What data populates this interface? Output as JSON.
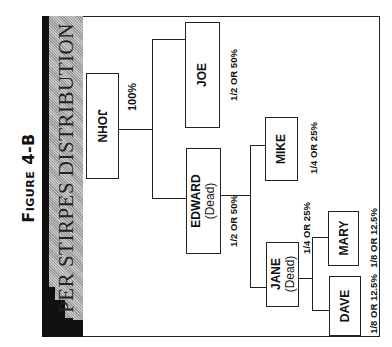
{
  "figure": {
    "label_prefix": "Figure",
    "label_number": "4-B",
    "title": "PER STIRPES DISTRIBUTION"
  },
  "colors": {
    "border": "#222222",
    "title_bar": "#111111",
    "band_gray": "#b0b0b0",
    "background": "#ffffff"
  },
  "tree": {
    "root": {
      "name": "JOHN",
      "share": "100%"
    },
    "children": [
      {
        "name": "JOE",
        "share": "1/2 OR 50%"
      },
      {
        "name": "EDWARD",
        "status": "(Dead)",
        "share": "1/2 OR 50%",
        "children": [
          {
            "name": "MIKE",
            "share": "1/4 OR 25%"
          },
          {
            "name": "JANE",
            "status": "(Dead)",
            "share": "1/4 OR 25%",
            "children": [
              {
                "name": "MARY",
                "share": "1/8 OR 12.5%"
              },
              {
                "name": "DAVE",
                "share": "1/8 OR 12.5%"
              }
            ]
          }
        ]
      }
    ]
  }
}
